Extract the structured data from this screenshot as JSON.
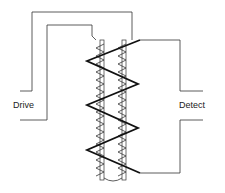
{
  "diagram": {
    "type": "coil-sensor-schematic",
    "labels": {
      "drive": "Drive",
      "detect": "Detect"
    },
    "colors": {
      "line": "#333333",
      "coil": "#111111",
      "background": "#ffffff"
    }
  }
}
